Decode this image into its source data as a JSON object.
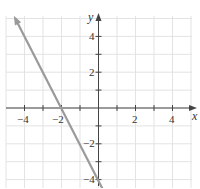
{
  "chart_data": {
    "type": "line",
    "title": "",
    "xlabel": "x",
    "ylabel": "y",
    "xlim": [
      -5,
      5
    ],
    "ylim": [
      -4.5,
      5
    ],
    "grid": true,
    "x_ticks": [
      -4,
      -2,
      2,
      4
    ],
    "y_ticks": [
      4,
      2,
      -2,
      -4
    ],
    "x_tick_labels": [
      "−4",
      "−2",
      "2",
      "4"
    ],
    "y_tick_labels": [
      "4",
      "2",
      "−2",
      "−4"
    ],
    "series": [
      {
        "name": "y = -2x - 4",
        "equation": "y = -2x - 4",
        "slope": -2,
        "intercept": -4,
        "x": [
          -4.5,
          -2,
          0,
          0.25
        ],
        "y": [
          5,
          0,
          -4,
          -4.5
        ],
        "arrow_start": true,
        "color": "#9a9a9a"
      }
    ],
    "key_points": [
      {
        "label": "x-intercept",
        "x": -2,
        "y": 0
      },
      {
        "label": "y-intercept",
        "x": 0,
        "y": -4
      }
    ]
  },
  "colors": {
    "grid": "#e3e3e3",
    "axis": "#444444",
    "line": "#9a9a9a"
  }
}
